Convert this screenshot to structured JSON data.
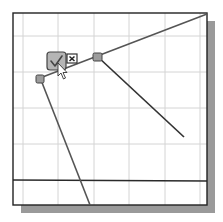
{
  "window": {
    "description": "CAD sketch viewport with grid and sketch lines",
    "colors": {
      "background": "#ffffff",
      "frame": "#222222",
      "shadow": "#9a9a9a",
      "grid": "#d4d4d4",
      "sketch_line": "#4a4a4a",
      "marker_fill": "#9c9c9c",
      "check_button_fill": "#b5b5b5"
    }
  },
  "icons": {
    "accept": "checkmark-icon",
    "cancel": "close-icon",
    "cursor": "mouse-pointer-icon",
    "endpoint": "endpoint-marker-icon"
  },
  "tooltips": {
    "accept": "Accept",
    "cancel": "Cancel"
  }
}
